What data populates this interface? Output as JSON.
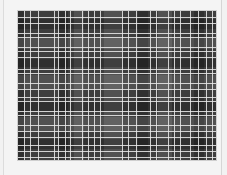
{
  "image": {
    "description": "grayscale plaid fabric swatch",
    "colors": {
      "background": "#f2f2f2",
      "frame": "#f4f4f4",
      "base": "#3e3e3e",
      "light_band": "rgba(255,255,255,0.10)",
      "dark_band": "rgba(0,0,0,0.22)",
      "thread": "rgba(235,235,235,0.85)"
    },
    "vertical_bands": [
      {
        "x": 0,
        "w": 6,
        "tone": "dark"
      },
      {
        "x": 40,
        "w": 10,
        "tone": "dark"
      },
      {
        "x": 56,
        "w": 10,
        "tone": "light"
      },
      {
        "x": 86,
        "w": 18,
        "tone": "light"
      },
      {
        "x": 120,
        "w": 10,
        "tone": "dark"
      },
      {
        "x": 140,
        "w": 14,
        "tone": "light"
      },
      {
        "x": 176,
        "w": 10,
        "tone": "dark"
      }
    ],
    "horizontal_bands": [
      {
        "y": 8,
        "h": 10,
        "tone": "dark"
      },
      {
        "y": 26,
        "h": 12,
        "tone": "light"
      },
      {
        "y": 48,
        "h": 8,
        "tone": "dark"
      },
      {
        "y": 64,
        "h": 14,
        "tone": "light"
      },
      {
        "y": 90,
        "h": 10,
        "tone": "dark"
      },
      {
        "y": 106,
        "h": 14,
        "tone": "light"
      },
      {
        "y": 128,
        "h": 10,
        "tone": "dark"
      }
    ],
    "vertical_lines": [
      6,
      12,
      20,
      36,
      40,
      47,
      52,
      64,
      70,
      76,
      82,
      104,
      110,
      118,
      132,
      138,
      150,
      156,
      162,
      172,
      180,
      188,
      194
    ],
    "horizontal_lines": [
      6,
      12,
      22,
      26,
      36,
      40,
      46,
      58,
      62,
      72,
      78,
      86,
      90,
      100,
      104,
      114,
      120,
      126,
      134,
      140,
      146
    ]
  }
}
